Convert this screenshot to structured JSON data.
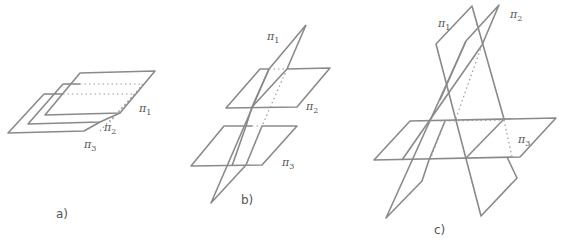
{
  "figures": [
    {
      "id": "a",
      "caption": "a)",
      "description": "Three parallel planes",
      "planes": [
        {
          "symbol": "π",
          "subscript": "1"
        },
        {
          "symbol": "π",
          "subscript": "2"
        },
        {
          "symbol": "π",
          "subscript": "3"
        }
      ]
    },
    {
      "id": "b",
      "caption": "b)",
      "description": "Two parallel planes cut by a third plane",
      "planes": [
        {
          "symbol": "π",
          "subscript": "1"
        },
        {
          "symbol": "π",
          "subscript": "2"
        },
        {
          "symbol": "π",
          "subscript": "3"
        }
      ]
    },
    {
      "id": "c",
      "caption": "c)",
      "description": "Three planes intersecting in pairs",
      "planes": [
        {
          "symbol": "π",
          "subscript": "1"
        },
        {
          "symbol": "π",
          "subscript": "2"
        },
        {
          "symbol": "π",
          "subscript": "3"
        }
      ]
    }
  ],
  "colors": {
    "line": "#8a8a8a",
    "label": "#555555",
    "background": "#ffffff"
  }
}
